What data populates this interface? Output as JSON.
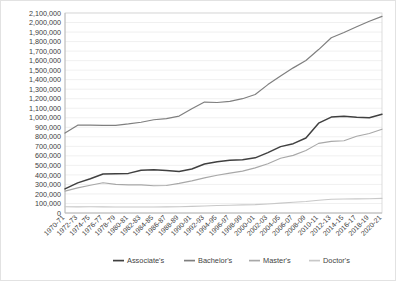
{
  "chart_data": {
    "type": "line",
    "title": "",
    "xlabel": "",
    "ylabel": "",
    "ylim": [
      0,
      2100000
    ],
    "ytick_step": 100000,
    "grid": true,
    "legend_position": "bottom",
    "yticks": [
      "2,100,000",
      "2,000,000",
      "1,900,000",
      "1,800,000",
      "1,700,000",
      "1,600,000",
      "1,500,000",
      "1,400,000",
      "1,300,000",
      "1,200,000",
      "1,100,000",
      "1,000,000",
      "900,000",
      "800,000",
      "700,000",
      "600,000",
      "500,000",
      "400,000",
      "300,000",
      "200,000",
      "100,000",
      "0"
    ],
    "categories": [
      "1970-71",
      "1972-73",
      "1974-75",
      "1976-77",
      "1978-79",
      "1980-81",
      "1982-83",
      "1984-85",
      "1986-87",
      "1988-89",
      "1990-91",
      "1992-93",
      "1994-95",
      "1996-97",
      "1998-99",
      "2000-01",
      "2002-03",
      "2004-05",
      "2006-07",
      "2008-09",
      "2010-11",
      "2012-13",
      "2014-15",
      "2016-17",
      "2018-19",
      "2020-21"
    ],
    "series": [
      {
        "name": "Associate's",
        "color": "#404040",
        "width": 1.5,
        "values": [
          253000,
          316000,
          360000,
          409000,
          412000,
          416000,
          449000,
          454000,
          446000,
          436000,
          462000,
          514000,
          539000,
          555000,
          560000,
          579000,
          634000,
          697000,
          728000,
          787000,
          943000,
          1007000,
          1017000,
          1005000,
          1001000,
          1037000
        ]
      },
      {
        "name": "Bachelor's",
        "color": "#7f7f7f",
        "width": 1.2,
        "values": [
          839000,
          922000,
          923000,
          920000,
          921000,
          935000,
          953000,
          979000,
          991000,
          1018000,
          1094000,
          1165000,
          1160000,
          1173000,
          1200000,
          1244000,
          1348000,
          1439000,
          1524000,
          1601000,
          1716000,
          1840000,
          1895000,
          1956000,
          2013000,
          2064000
        ]
      },
      {
        "name": "Master's",
        "color": "#a8a8a8",
        "width": 1.1,
        "values": [
          230000,
          264000,
          292000,
          318000,
          301000,
          295000,
          295000,
          286000,
          289000,
          311000,
          337000,
          369000,
          397000,
          419000,
          440000,
          474000,
          518000,
          575000,
          605000,
          657000,
          731000,
          752000,
          759000,
          805000,
          834000,
          880000
        ]
      },
      {
        "name": "Doctor's",
        "color": "#c8c8c8",
        "width": 1.1,
        "values": [
          64998,
          64622,
          65000,
          64000,
          63000,
          63000,
          63000,
          63000,
          64000,
          66000,
          70000,
          74000,
          79000,
          82000,
          85000,
          88000,
          95000,
          104000,
          113000,
          120000,
          134000,
          144000,
          147000,
          148000,
          150000,
          154000
        ]
      }
    ],
    "legend": [
      {
        "label": "Associate's",
        "color": "#404040"
      },
      {
        "label": "Bachelor's",
        "color": "#7f7f7f"
      },
      {
        "label": "Master's",
        "color": "#a8a8a8"
      },
      {
        "label": "Doctor's",
        "color": "#c8c8c8"
      }
    ]
  }
}
